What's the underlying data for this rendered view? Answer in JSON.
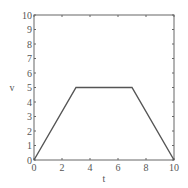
{
  "chart_data": {
    "type": "line",
    "title": "",
    "xlabel": "t",
    "ylabel": "v",
    "xlim": [
      0,
      10
    ],
    "ylim": [
      0,
      10
    ],
    "xticks": [
      0,
      2,
      4,
      6,
      8,
      10
    ],
    "yticks": [
      0,
      1,
      2,
      3,
      4,
      5,
      6,
      7,
      8,
      9,
      10
    ],
    "grid": false,
    "legend": null,
    "series": [
      {
        "name": "v(t)",
        "color": "#555555",
        "x": [
          0,
          3,
          7,
          10
        ],
        "y": [
          0,
          5,
          5,
          0
        ]
      }
    ]
  },
  "layout": {
    "plot": {
      "left": 34,
      "top": 15,
      "right": 174,
      "bottom": 160
    },
    "colors": {
      "axis": "#666666",
      "text": "#555555",
      "line": "#555555"
    }
  }
}
